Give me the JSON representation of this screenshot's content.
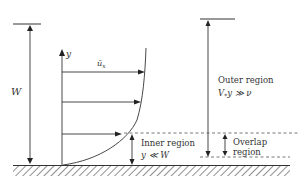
{
  "diagram": {
    "type": "boundary-layer-velocity-profile",
    "labels": {
      "height": "W",
      "y_axis": "y",
      "velocity": "ū",
      "velocity_sub": "x",
      "outer_region": "Outer region",
      "outer_condition_v": "V",
      "outer_condition_sub": "*",
      "outer_condition_rest": "y ≫ ν",
      "inner_region": "Inner region",
      "inner_condition": "y ≪ W",
      "overlap_line1": "Overlap",
      "overlap_line2": "region"
    },
    "colors": {
      "line": "#333333",
      "dash": "#555555",
      "background": "#ffffff"
    }
  }
}
